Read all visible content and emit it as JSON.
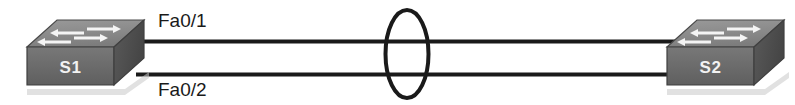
{
  "diagram": {
    "type": "network-topology",
    "background_color": "#ffffff",
    "link_color": "#1a1a1a",
    "loop_indicator_color": "#1a1a1a",
    "devices": [
      {
        "id": "S1",
        "label": "S1",
        "icon": "switch-icon",
        "role": "layer2-switch",
        "position": "left",
        "label_color": "#f2f2f2",
        "body_color": "#6e6e6e",
        "top_color": "#8a8a8a",
        "side_color": "#4f4f4f"
      },
      {
        "id": "S2",
        "label": "S2",
        "icon": "switch-icon",
        "role": "layer2-switch",
        "position": "right",
        "label_color": "#f2f2f2",
        "body_color": "#6e6e6e",
        "top_color": "#8a8a8a",
        "side_color": "#4f4f4f"
      }
    ],
    "links": [
      {
        "id": "link-top",
        "label": "Fa0/1",
        "from": "S1",
        "to": "S2",
        "label_position": "above-left"
      },
      {
        "id": "link-bottom",
        "label": "Fa0/2",
        "from": "S1",
        "to": "S2",
        "label_position": "below-left"
      }
    ],
    "annotations": [
      {
        "id": "loop-ellipse",
        "shape": "ellipse",
        "meaning": "switching-loop-indicator",
        "label": ""
      }
    ]
  }
}
